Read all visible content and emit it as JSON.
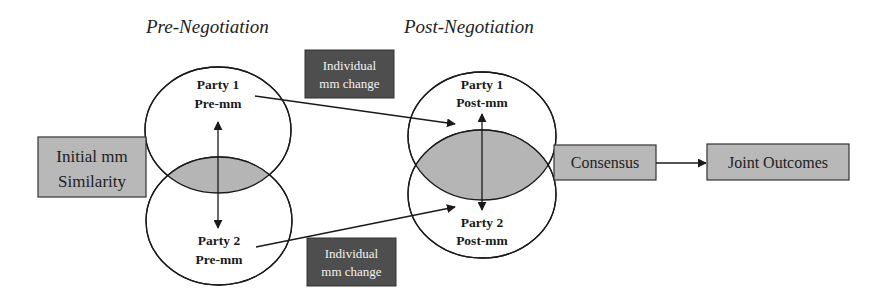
{
  "titles": {
    "pre": "Pre-Negotiation",
    "post": "Post-Negotiation"
  },
  "pre": {
    "party1": {
      "line1": "Party 1",
      "line2": "Pre-mm"
    },
    "party2": {
      "line1": "Party 2",
      "line2": "Pre-mm"
    }
  },
  "post": {
    "party1": {
      "line1": "Party 1",
      "line2": "Post-mm"
    },
    "party2": {
      "line1": "Party 2",
      "line2": "Post-mm"
    }
  },
  "boxes": {
    "initial_similarity": {
      "line1": "Initial mm",
      "line2": "Similarity"
    },
    "change_top": {
      "line1": "Individual",
      "line2": "mm change"
    },
    "change_bottom": {
      "line1": "Individual",
      "line2": "mm change"
    },
    "consensus": "Consensus",
    "joint_outcomes": "Joint Outcomes"
  },
  "colors": {
    "light_box_fill": "#b8b8b8",
    "dark_box_fill": "#4e4e4e",
    "overlap_fill": "#b5b5b5",
    "stroke": "#1a1a1a"
  }
}
